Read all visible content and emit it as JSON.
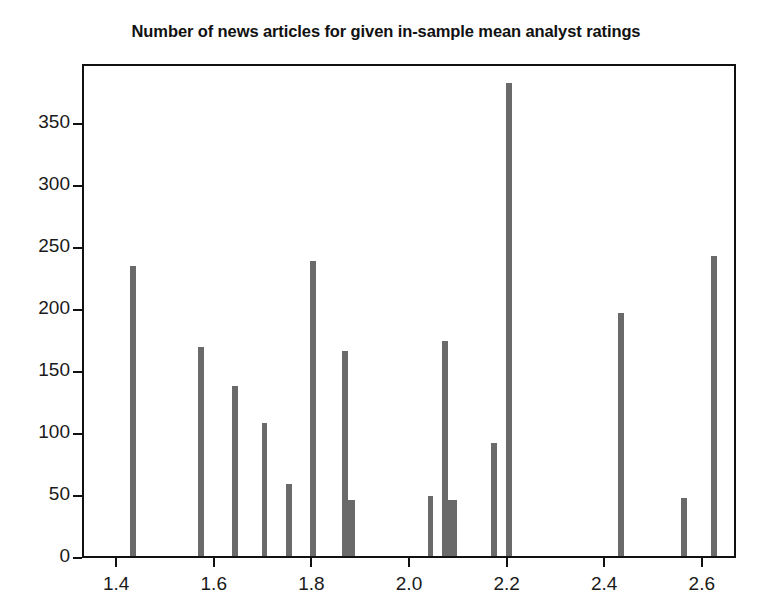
{
  "chart_data": {
    "type": "bar",
    "title": "Number of news articles for given in-sample mean analyst ratings",
    "xlabel": "",
    "ylabel": "",
    "xlim": [
      1.33,
      2.67
    ],
    "ylim": [
      0,
      398
    ],
    "grid": false,
    "legend": null,
    "bar_color": "#6a6a6a",
    "frame_color": "#111111",
    "xticks": [
      "1.4",
      "1.6",
      "1.8",
      "2.0",
      "2.2",
      "2.4",
      "2.6"
    ],
    "xtick_values": [
      1.4,
      1.6,
      1.8,
      2.0,
      2.2,
      2.4,
      2.6
    ],
    "yticks": [
      "0",
      "50",
      "100",
      "150",
      "200",
      "250",
      "300",
      "350"
    ],
    "ytick_values": [
      0,
      50,
      100,
      150,
      200,
      250,
      300,
      350
    ],
    "x": [
      1.43,
      1.57,
      1.64,
      1.7,
      1.75,
      1.8,
      1.865,
      1.875,
      2.04,
      2.07,
      2.085,
      2.17,
      2.2,
      2.43,
      2.56,
      2.62
    ],
    "values": [
      234,
      168,
      137,
      107,
      58,
      238,
      165,
      45,
      48,
      173,
      45,
      91,
      381,
      196,
      47,
      242
    ],
    "bar_widths": [
      0.012,
      0.012,
      0.012,
      0.012,
      0.012,
      0.012,
      0.012,
      0.02,
      0.012,
      0.012,
      0.02,
      0.012,
      0.012,
      0.012,
      0.012,
      0.012
    ]
  }
}
